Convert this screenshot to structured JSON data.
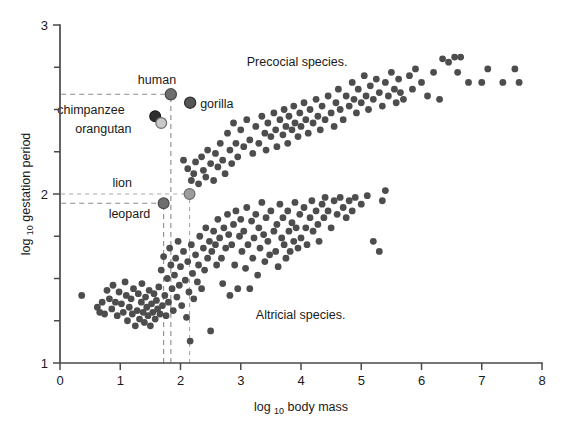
{
  "chart_data": {
    "type": "scatter",
    "title": "",
    "xlabel": "log 10 body mass",
    "xlabel_base": "log",
    "xlabel_sub": "10",
    "xlabel_rest": "body mass",
    "ylabel": "log 10 gestation period",
    "ylabel_base": "log",
    "ylabel_sub": "10",
    "ylabel_rest": "gestation period",
    "xlim": [
      0,
      8
    ],
    "ylim": [
      1,
      3
    ],
    "xticks": [
      0,
      1,
      2,
      3,
      4,
      5,
      6,
      7,
      8
    ],
    "xtick_labels": [
      "0",
      "1",
      "2",
      "3",
      "4",
      "5",
      "6",
      "7",
      "8"
    ],
    "yticks": [
      1,
      2,
      3
    ],
    "ytick_labels": [
      "1",
      "2",
      "3"
    ],
    "yminor_ticks": [
      1.25,
      1.5,
      1.75,
      2.25,
      2.5,
      2.75
    ],
    "grid": false,
    "legend": null,
    "point_color": "#4d4d4d",
    "point_radius": 3.4,
    "annotations": [
      {
        "name": "precocial-annotation",
        "text": "Precocial species.",
        "x": 3.1,
        "y": 2.76
      },
      {
        "name": "altricial-annotation",
        "text": "Altricial species.",
        "x": 3.25,
        "y": 1.26
      }
    ],
    "highlighted_points": [
      {
        "name": "human",
        "label": "human",
        "x": 1.84,
        "y": 2.59,
        "color": "#6e6e6e",
        "edge": "#4a4a4a",
        "r": 5.6,
        "label_dx": -33,
        "label_dy": -10
      },
      {
        "name": "gorilla",
        "label": "gorilla",
        "x": 2.16,
        "y": 2.54,
        "color": "#555555",
        "edge": "#2c2c2c",
        "r": 5.6,
        "label_dx": 10,
        "label_dy": 5
      },
      {
        "name": "chimpanzee",
        "label": "chimpanzee",
        "x": 1.58,
        "y": 2.46,
        "color": "#2e2e2e",
        "edge": "#1a1a1a",
        "r": 5.4,
        "label_dx": -98,
        "label_dy": -2
      },
      {
        "name": "orangutan",
        "label": "orangutan",
        "x": 1.68,
        "y": 2.42,
        "color": "#c9c9c9",
        "edge": "#6b6b6b",
        "r": 5.4,
        "label_dx": -86,
        "label_dy": 10
      },
      {
        "name": "lion",
        "label": "lion",
        "x": 2.15,
        "y": 2.0,
        "color": "#9c9c9c",
        "edge": "#6b6b6b",
        "r": 5.4,
        "label_dx": -77,
        "label_dy": -7
      },
      {
        "name": "leopard",
        "label": "leopard",
        "x": 1.72,
        "y": 1.945,
        "color": "#6e6e6e",
        "edge": "#4a4a4a",
        "r": 5.4,
        "label_dx": -55,
        "label_dy": 15
      }
    ],
    "guide_lines": {
      "horizontal": [
        {
          "name": "human-guide-h",
          "y": 2.59,
          "x_from": 0.02,
          "x_to": 1.84,
          "style": "dark"
        },
        {
          "name": "lion-guide-h",
          "y": 2.0,
          "x_from": 0.02,
          "x_to": 2.15,
          "style": "light"
        },
        {
          "name": "leopard-guide-h",
          "y": 1.945,
          "x_from": 0.02,
          "x_to": 1.72,
          "style": "dark"
        }
      ],
      "vertical": [
        {
          "name": "human-guide-v",
          "x": 1.84,
          "y_from": 1.0,
          "y_to": 2.59,
          "style": "dark"
        },
        {
          "name": "leopard-guide-v",
          "x": 1.72,
          "y_from": 1.0,
          "y_to": 1.945,
          "style": "dark"
        },
        {
          "name": "lion-guide-v",
          "x": 2.15,
          "y_from": 1.0,
          "y_to": 2.0,
          "style": "light"
        }
      ]
    },
    "points": [
      [
        0.36,
        1.4
      ],
      [
        0.62,
        1.33
      ],
      [
        0.66,
        1.3
      ],
      [
        0.7,
        1.36
      ],
      [
        0.74,
        1.29
      ],
      [
        0.78,
        1.43
      ],
      [
        0.82,
        1.38
      ],
      [
        0.86,
        1.32
      ],
      [
        0.88,
        1.46
      ],
      [
        0.92,
        1.36
      ],
      [
        0.95,
        1.28
      ],
      [
        0.98,
        1.42
      ],
      [
        1.02,
        1.35
      ],
      [
        1.05,
        1.3
      ],
      [
        1.08,
        1.48
      ],
      [
        1.1,
        1.4
      ],
      [
        1.12,
        1.25
      ],
      [
        1.15,
        1.33
      ],
      [
        1.18,
        1.38
      ],
      [
        1.2,
        1.29
      ],
      [
        1.22,
        1.44
      ],
      [
        1.25,
        1.22
      ],
      [
        1.28,
        1.31
      ],
      [
        1.3,
        1.41
      ],
      [
        1.32,
        1.26
      ],
      [
        1.35,
        1.36
      ],
      [
        1.36,
        1.47
      ],
      [
        1.38,
        1.3
      ],
      [
        1.4,
        1.24
      ],
      [
        1.42,
        1.39
      ],
      [
        1.44,
        1.33
      ],
      [
        1.46,
        1.28
      ],
      [
        1.48,
        1.43
      ],
      [
        1.5,
        1.22
      ],
      [
        1.52,
        1.35
      ],
      [
        1.54,
        1.3
      ],
      [
        1.56,
        1.41
      ],
      [
        1.58,
        1.26
      ],
      [
        1.6,
        1.37
      ],
      [
        1.62,
        1.32
      ],
      [
        1.64,
        1.45
      ],
      [
        1.66,
        1.29
      ],
      [
        1.68,
        1.55
      ],
      [
        1.7,
        1.34
      ],
      [
        1.72,
        1.63
      ],
      [
        1.74,
        1.4
      ],
      [
        1.76,
        1.28
      ],
      [
        1.78,
        1.5
      ],
      [
        1.8,
        1.36
      ],
      [
        1.82,
        1.68
      ],
      [
        1.84,
        1.58
      ],
      [
        1.86,
        1.44
      ],
      [
        1.88,
        1.31
      ],
      [
        1.9,
        1.52
      ],
      [
        1.92,
        1.62
      ],
      [
        1.94,
        1.39
      ],
      [
        1.96,
        1.72
      ],
      [
        1.98,
        1.46
      ],
      [
        2.0,
        1.57
      ],
      [
        2.02,
        1.34
      ],
      [
        2.05,
        1.66
      ],
      [
        2.08,
        1.49
      ],
      [
        2.1,
        1.27
      ],
      [
        2.12,
        1.6
      ],
      [
        2.14,
        1.42
      ],
      [
        2.16,
        1.13
      ],
      [
        2.18,
        1.7
      ],
      [
        2.2,
        1.53
      ],
      [
        2.22,
        1.38
      ],
      [
        2.25,
        1.64
      ],
      [
        2.28,
        1.48
      ],
      [
        2.3,
        1.58
      ],
      [
        2.32,
        1.75
      ],
      [
        2.35,
        1.44
      ],
      [
        2.38,
        1.68
      ],
      [
        2.4,
        1.55
      ],
      [
        2.42,
        1.8
      ],
      [
        2.45,
        1.62
      ],
      [
        2.48,
        1.72
      ],
      [
        2.5,
        1.19
      ],
      [
        2.52,
        1.66
      ],
      [
        2.55,
        1.78
      ],
      [
        2.58,
        1.7
      ],
      [
        2.6,
        1.58
      ],
      [
        2.62,
        1.85
      ],
      [
        2.65,
        1.74
      ],
      [
        2.68,
        1.62
      ],
      [
        2.7,
        1.47
      ],
      [
        2.72,
        1.8
      ],
      [
        2.75,
        1.68
      ],
      [
        2.78,
        1.88
      ],
      [
        2.8,
        1.76
      ],
      [
        2.82,
        1.4
      ],
      [
        2.85,
        1.7
      ],
      [
        2.88,
        1.82
      ],
      [
        2.9,
        1.58
      ],
      [
        2.92,
        1.9
      ],
      [
        2.95,
        1.44
      ],
      [
        2.98,
        1.75
      ],
      [
        3.0,
        1.85
      ],
      [
        3.02,
        1.66
      ],
      [
        3.05,
        1.78
      ],
      [
        3.08,
        1.56
      ],
      [
        3.1,
        1.92
      ],
      [
        3.12,
        1.7
      ],
      [
        3.15,
        1.44
      ],
      [
        3.18,
        1.84
      ],
      [
        3.2,
        1.62
      ],
      [
        3.22,
        1.74
      ],
      [
        3.25,
        1.88
      ],
      [
        3.28,
        1.52
      ],
      [
        3.3,
        1.8
      ],
      [
        3.32,
        1.68
      ],
      [
        3.35,
        1.95
      ],
      [
        3.38,
        1.76
      ],
      [
        3.4,
        1.6
      ],
      [
        3.42,
        1.86
      ],
      [
        3.45,
        1.72
      ],
      [
        3.48,
        1.64
      ],
      [
        3.5,
        1.9
      ],
      [
        3.55,
        1.78
      ],
      [
        3.58,
        1.66
      ],
      [
        3.6,
        1.82
      ],
      [
        3.62,
        1.57
      ],
      [
        3.65,
        1.94
      ],
      [
        3.68,
        1.74
      ],
      [
        3.7,
        1.86
      ],
      [
        3.72,
        1.7
      ],
      [
        3.75,
        1.62
      ],
      [
        3.78,
        1.9
      ],
      [
        3.8,
        1.78
      ],
      [
        3.82,
        1.66
      ],
      [
        3.85,
        1.83
      ],
      [
        3.88,
        1.72
      ],
      [
        3.9,
        1.95
      ],
      [
        3.92,
        1.8
      ],
      [
        3.95,
        1.68
      ],
      [
        3.98,
        1.88
      ],
      [
        4.0,
        1.74
      ],
      [
        4.05,
        1.92
      ],
      [
        4.08,
        1.8
      ],
      [
        4.1,
        1.7
      ],
      [
        4.15,
        1.86
      ],
      [
        4.18,
        1.96
      ],
      [
        4.2,
        1.78
      ],
      [
        4.25,
        1.9
      ],
      [
        4.28,
        1.82
      ],
      [
        4.3,
        1.72
      ],
      [
        4.35,
        1.94
      ],
      [
        4.38,
        1.86
      ],
      [
        4.4,
        1.98
      ],
      [
        4.45,
        1.9
      ],
      [
        4.5,
        1.8
      ],
      [
        4.55,
        1.96
      ],
      [
        4.6,
        1.88
      ],
      [
        4.65,
        1.98
      ],
      [
        4.7,
        1.92
      ],
      [
        4.75,
        1.86
      ],
      [
        4.8,
        1.96
      ],
      [
        4.85,
        1.9
      ],
      [
        4.9,
        1.98
      ],
      [
        5.0,
        1.94
      ],
      [
        5.1,
        1.99
      ],
      [
        5.2,
        1.72
      ],
      [
        5.3,
        1.66
      ],
      [
        5.35,
        1.96
      ],
      [
        5.4,
        2.02
      ],
      [
        2.05,
        2.2
      ],
      [
        2.12,
        2.15
      ],
      [
        2.18,
        2.08
      ],
      [
        2.22,
        2.12
      ],
      [
        2.25,
        2.19
      ],
      [
        2.3,
        2.06
      ],
      [
        2.35,
        2.22
      ],
      [
        2.38,
        2.14
      ],
      [
        2.42,
        2.1
      ],
      [
        2.45,
        2.26
      ],
      [
        2.5,
        2.18
      ],
      [
        2.55,
        2.08
      ],
      [
        2.58,
        2.24
      ],
      [
        2.62,
        2.16
      ],
      [
        2.66,
        2.3
      ],
      [
        2.7,
        2.2
      ],
      [
        2.74,
        2.12
      ],
      [
        2.78,
        2.36
      ],
      [
        2.82,
        2.26
      ],
      [
        2.85,
        2.18
      ],
      [
        2.88,
        2.42
      ],
      [
        2.92,
        2.3
      ],
      [
        2.95,
        2.22
      ],
      [
        3.0,
        2.38
      ],
      [
        3.05,
        2.28
      ],
      [
        3.1,
        2.44
      ],
      [
        3.15,
        2.32
      ],
      [
        3.2,
        2.24
      ],
      [
        3.25,
        2.4
      ],
      [
        3.3,
        2.3
      ],
      [
        3.35,
        2.46
      ],
      [
        3.4,
        2.36
      ],
      [
        3.42,
        2.26
      ],
      [
        3.45,
        2.42
      ],
      [
        3.5,
        2.34
      ],
      [
        3.55,
        2.48
      ],
      [
        3.58,
        2.38
      ],
      [
        3.6,
        2.28
      ],
      [
        3.65,
        2.44
      ],
      [
        3.7,
        2.35
      ],
      [
        3.72,
        2.5
      ],
      [
        3.75,
        2.4
      ],
      [
        3.78,
        2.3
      ],
      [
        3.8,
        2.46
      ],
      [
        3.85,
        2.38
      ],
      [
        3.88,
        2.52
      ],
      [
        3.9,
        2.42
      ],
      [
        3.95,
        2.34
      ],
      [
        3.98,
        2.48
      ],
      [
        4.0,
        2.4
      ],
      [
        4.05,
        2.54
      ],
      [
        4.08,
        2.44
      ],
      [
        4.12,
        2.36
      ],
      [
        4.15,
        2.5
      ],
      [
        4.2,
        2.42
      ],
      [
        4.25,
        2.56
      ],
      [
        4.28,
        2.46
      ],
      [
        4.32,
        2.38
      ],
      [
        4.35,
        2.52
      ],
      [
        4.4,
        2.44
      ],
      [
        4.45,
        2.58
      ],
      [
        4.5,
        2.48
      ],
      [
        4.55,
        2.4
      ],
      [
        4.58,
        2.54
      ],
      [
        4.62,
        2.62
      ],
      [
        4.65,
        2.5
      ],
      [
        4.7,
        2.44
      ],
      [
        4.75,
        2.58
      ],
      [
        4.8,
        2.52
      ],
      [
        4.85,
        2.66
      ],
      [
        4.88,
        2.56
      ],
      [
        4.92,
        2.48
      ],
      [
        4.95,
        2.62
      ],
      [
        5.0,
        2.54
      ],
      [
        5.05,
        2.7
      ],
      [
        5.08,
        2.58
      ],
      [
        5.12,
        2.5
      ],
      [
        5.15,
        2.64
      ],
      [
        5.2,
        2.56
      ],
      [
        5.25,
        2.68
      ],
      [
        5.3,
        2.6
      ],
      [
        5.35,
        2.52
      ],
      [
        5.4,
        2.66
      ],
      [
        5.45,
        2.58
      ],
      [
        5.5,
        2.72
      ],
      [
        5.55,
        2.62
      ],
      [
        5.58,
        2.54
      ],
      [
        5.62,
        2.68
      ],
      [
        5.65,
        2.6
      ],
      [
        5.7,
        2.56
      ],
      [
        5.8,
        2.7
      ],
      [
        5.85,
        2.62
      ],
      [
        5.9,
        2.74
      ],
      [
        6.0,
        2.66
      ],
      [
        6.1,
        2.58
      ],
      [
        6.2,
        2.72
      ],
      [
        6.3,
        2.56
      ],
      [
        6.35,
        2.8
      ],
      [
        6.45,
        2.78
      ],
      [
        6.55,
        2.81
      ],
      [
        6.65,
        2.81
      ],
      [
        6.6,
        2.72
      ],
      [
        6.78,
        2.66
      ],
      [
        7.0,
        2.66
      ],
      [
        7.1,
        2.74
      ],
      [
        7.35,
        2.66
      ],
      [
        7.55,
        2.74
      ],
      [
        7.62,
        2.66
      ]
    ]
  }
}
